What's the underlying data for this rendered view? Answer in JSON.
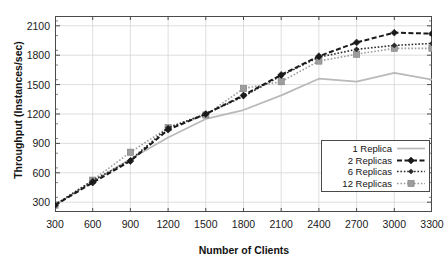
{
  "chart_data": {
    "type": "line",
    "title": "",
    "xlabel": "Number of Clients",
    "ylabel": "Throughput (Instances/sec)",
    "x": [
      300,
      600,
      900,
      1200,
      1500,
      1800,
      2100,
      2400,
      2700,
      3000,
      3300
    ],
    "xticklabels": [
      "300",
      "600",
      "900",
      "1200",
      "1500",
      "1800",
      "2100",
      "2400",
      "2700",
      "3000",
      "3300"
    ],
    "yticklabels": [
      "300",
      "600",
      "900",
      "1200",
      "1500",
      "1800",
      "2100"
    ],
    "yticks": [
      300,
      600,
      900,
      1200,
      1500,
      1800,
      2100
    ],
    "xlim": [
      300,
      3300
    ],
    "ylim": [
      200,
      2200
    ],
    "grid": true,
    "legend_position": "lower-right-inside",
    "series": [
      {
        "name": "1 Replica",
        "style": "solid",
        "marker": "none",
        "color": "#b9b9b9",
        "values": [
          270,
          510,
          740,
          960,
          1150,
          1240,
          1390,
          1560,
          1530,
          1620,
          1550
        ]
      },
      {
        "name": "2 Replicas",
        "style": "dashed",
        "marker": "diamond",
        "color": "#1a1a1a",
        "values": [
          270,
          500,
          720,
          1040,
          1200,
          1390,
          1600,
          1790,
          1930,
          2030,
          2020
        ]
      },
      {
        "name": "6 Replicas",
        "style": "dotted",
        "marker": "diamond-small",
        "color": "#2b2b2b",
        "values": [
          275,
          520,
          730,
          1060,
          1200,
          1380,
          1590,
          1780,
          1860,
          1900,
          1920
        ]
      },
      {
        "name": "12 Replicas",
        "style": "dotted",
        "marker": "square",
        "color": "#9d9d9d",
        "values": [
          270,
          525,
          810,
          1060,
          1190,
          1460,
          1530,
          1740,
          1810,
          1870,
          1870
        ]
      }
    ]
  },
  "legend": {
    "items": [
      {
        "label": "1 Replica"
      },
      {
        "label": "2 Replicas"
      },
      {
        "label": "6 Replicas"
      },
      {
        "label": "12 Replicas"
      }
    ]
  },
  "colors": {
    "axis": "#4a4a4a",
    "grid": "#d6d6d6",
    "text": "#141414",
    "light_series": "#b9b9b9",
    "dark_series": "#1a1a1a",
    "mid_series": "#9d9d9d"
  }
}
